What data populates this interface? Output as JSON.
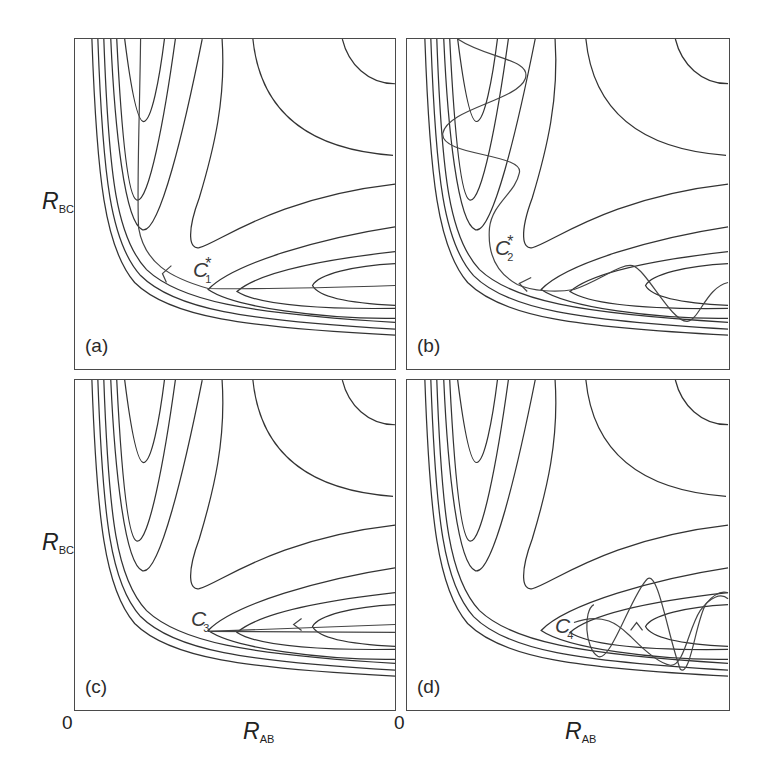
{
  "figure": {
    "y_axis_label": {
      "main": "R",
      "sub": "BC"
    },
    "x_axis_label": {
      "main": "R",
      "sub": "AB"
    },
    "origin_labels": [
      "0",
      "0"
    ],
    "line_color": "#333333"
  },
  "panels": [
    {
      "id": "a",
      "label": "(a)",
      "point": {
        "main": "C",
        "sub": "1",
        "sup": "*"
      },
      "trajectory": "reaction path along valley floor, arrow pointing back toward entrance valley"
    },
    {
      "id": "b",
      "label": "(b)",
      "point": {
        "main": "C",
        "sub": "2",
        "sup": "*"
      },
      "trajectory": "oscillating trajectory through corner"
    },
    {
      "id": "c",
      "label": "(c)",
      "point": {
        "main": "C",
        "sub": "3",
        "sup": ""
      },
      "trajectory": "straight line along exit valley axis, arrow pointing left"
    },
    {
      "id": "d",
      "label": "(d)",
      "point": {
        "main": "C",
        "sub": "4",
        "sup": ""
      },
      "trajectory": "vibrating trajectory in exit valley"
    }
  ]
}
